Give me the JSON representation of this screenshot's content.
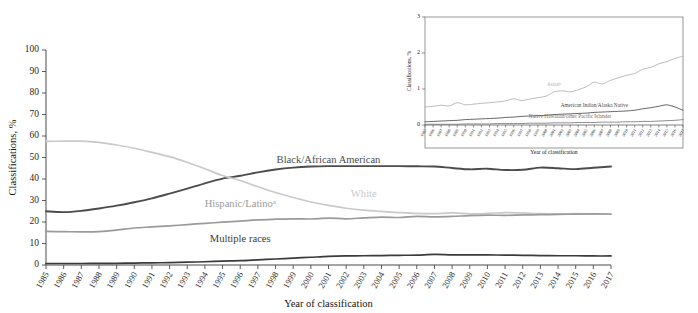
{
  "figure": {
    "title": "",
    "background": "#ffffff"
  },
  "chart_data": [
    {
      "id": "main",
      "type": "line",
      "title": "",
      "xlabel": "Year of classification",
      "ylabel": "Classifications, %",
      "ylim": [
        0,
        100
      ],
      "yticks": [
        0,
        10,
        20,
        30,
        40,
        50,
        60,
        70,
        80,
        90,
        100
      ],
      "xlim": [
        1985,
        2017
      ],
      "grid": false,
      "legend_position": "inline-labels",
      "x": [
        1985,
        1986,
        1987,
        1988,
        1989,
        1990,
        1991,
        1992,
        1993,
        1994,
        1995,
        1996,
        1997,
        1998,
        1999,
        2000,
        2001,
        2002,
        2003,
        2004,
        2005,
        2006,
        2007,
        2008,
        2009,
        2010,
        2011,
        2012,
        2013,
        2014,
        2015,
        2016,
        2017
      ],
      "xticklabels": [
        "1985",
        "1986",
        "1987",
        "1988",
        "1989",
        "1990",
        "1991",
        "1992",
        "1993",
        "1994",
        "1995",
        "1996",
        "1997",
        "1998",
        "1999",
        "2000",
        "2001",
        "2002",
        "2003",
        "2004",
        "2005",
        "2006",
        "2007",
        "2008",
        "2009",
        "2010",
        "2011",
        "2012",
        "2013",
        "2014",
        "2015",
        "2016",
        "2017"
      ],
      "series": [
        {
          "name": "Black/African American",
          "label": "Black/African American",
          "color": "#4c4c4c",
          "width": 1.9,
          "label_x": 2001,
          "label_y": 47.5,
          "values": [
            25.0,
            24.6,
            25.2,
            26.3,
            27.6,
            29.2,
            31.0,
            33.2,
            35.5,
            38.0,
            40.2,
            41.5,
            43.1,
            44.4,
            45.3,
            45.8,
            46.0,
            46.0,
            46.0,
            46.0,
            46.0,
            45.9,
            45.8,
            45.1,
            44.5,
            44.8,
            44.2,
            44.3,
            45.3,
            45.0,
            44.6,
            45.2,
            45.8
          ]
        },
        {
          "name": "White",
          "label": "White",
          "color": "#c9c9c9",
          "width": 1.7,
          "label_x": 2003,
          "label_y": 31.5,
          "values": [
            57.5,
            57.6,
            57.6,
            57.0,
            55.8,
            54.3,
            52.4,
            50.4,
            47.8,
            44.8,
            41.6,
            39.3,
            36.4,
            33.7,
            31.4,
            29.3,
            27.7,
            26.4,
            25.5,
            24.9,
            24.4,
            24.0,
            23.9,
            24.2,
            23.8,
            24.0,
            24.4,
            24.2,
            23.9,
            23.8,
            23.9,
            23.8,
            23.6
          ]
        },
        {
          "name": "Hispanic/Latino",
          "label": "Hispanic/Latinoᵃ",
          "color": "#9a9a9a",
          "width": 1.7,
          "label_x": 1996,
          "label_y": 27.0,
          "values": [
            15.6,
            15.5,
            15.4,
            15.5,
            16.2,
            17.2,
            17.7,
            18.2,
            18.8,
            19.4,
            19.9,
            20.4,
            21.0,
            21.3,
            21.5,
            21.4,
            21.8,
            21.5,
            21.9,
            22.3,
            22.1,
            22.6,
            22.4,
            22.6,
            23.0,
            23.2,
            23.1,
            23.3,
            23.4,
            23.5,
            23.7,
            23.8,
            23.7
          ]
        },
        {
          "name": "Multiple races",
          "label": "Multiple races",
          "color": "#3b3b3b",
          "width": 1.7,
          "label_x": 1996,
          "label_y": 10.5,
          "values": [
            0.7,
            0.7,
            0.7,
            0.8,
            0.8,
            0.9,
            1.0,
            1.1,
            1.3,
            1.5,
            1.8,
            2.0,
            2.4,
            2.8,
            3.2,
            3.6,
            4.0,
            4.2,
            4.3,
            4.4,
            4.5,
            4.6,
            4.9,
            4.7,
            4.7,
            4.7,
            4.6,
            4.5,
            4.4,
            4.3,
            4.3,
            4.2,
            4.2
          ]
        }
      ]
    },
    {
      "id": "inset",
      "type": "line",
      "title": "",
      "xlabel": "Year of classification",
      "ylabel": "Classifications, %",
      "ylim": [
        0,
        3
      ],
      "yticks": [
        0,
        1,
        2,
        3
      ],
      "xlim": [
        1985,
        2017
      ],
      "grid": false,
      "legend_position": "inline-labels",
      "x": [
        1985,
        1986,
        1987,
        1988,
        1989,
        1990,
        1991,
        1992,
        1993,
        1994,
        1995,
        1996,
        1997,
        1998,
        1999,
        2000,
        2001,
        2002,
        2003,
        2004,
        2005,
        2006,
        2007,
        2008,
        2009,
        2010,
        2011,
        2012,
        2013,
        2014,
        2015,
        2016,
        2017
      ],
      "xticklabels": [
        "1985",
        "1986",
        "1987",
        "1988",
        "1989",
        "1990",
        "1991",
        "1992",
        "1993",
        "1994",
        "1995",
        "1996",
        "1997",
        "1998",
        "1999",
        "2000",
        "2001",
        "2002",
        "2003",
        "2004",
        "2005",
        "2006",
        "2007",
        "2008",
        "2009",
        "2010",
        "2011",
        "2012",
        "2013",
        "2014",
        "2015",
        "2016",
        "2017"
      ],
      "series": [
        {
          "name": "Asian",
          "label": "Asianᵇ",
          "color": "#b4b4b4",
          "width": 0.9,
          "label_x": 2001,
          "label_y": 1.08,
          "values": [
            0.5,
            0.52,
            0.55,
            0.53,
            0.62,
            0.56,
            0.58,
            0.6,
            0.62,
            0.64,
            0.67,
            0.73,
            0.68,
            0.72,
            0.76,
            0.8,
            0.92,
            0.95,
            0.92,
            0.98,
            1.06,
            1.19,
            1.14,
            1.24,
            1.31,
            1.38,
            1.43,
            1.55,
            1.6,
            1.7,
            1.76,
            1.85,
            1.91
          ]
        },
        {
          "name": "American Indian/Alaska Native",
          "label": "American Indian/Alaska Native",
          "color": "#4a4a4a",
          "width": 0.85,
          "label_x": 2006,
          "label_y": 0.5,
          "values": [
            0.09,
            0.1,
            0.11,
            0.12,
            0.13,
            0.15,
            0.16,
            0.17,
            0.18,
            0.19,
            0.21,
            0.22,
            0.24,
            0.25,
            0.26,
            0.27,
            0.29,
            0.3,
            0.31,
            0.32,
            0.33,
            0.35,
            0.36,
            0.37,
            0.38,
            0.39,
            0.41,
            0.45,
            0.48,
            0.52,
            0.56,
            0.5,
            0.41
          ]
        },
        {
          "name": "Native Hawaiian/other Pacific Islander",
          "label": "Native Hawaiian/other Pacific Islander",
          "color": "#6e6e6e",
          "width": 0.8,
          "label_x": 2003,
          "label_y": 0.2,
          "values": [
            0.02,
            0.02,
            0.02,
            0.02,
            0.02,
            0.03,
            0.03,
            0.03,
            0.03,
            0.04,
            0.04,
            0.04,
            0.04,
            0.05,
            0.05,
            0.05,
            0.06,
            0.06,
            0.06,
            0.07,
            0.07,
            0.07,
            0.08,
            0.08,
            0.08,
            0.09,
            0.09,
            0.1,
            0.1,
            0.11,
            0.12,
            0.13,
            0.15
          ]
        }
      ]
    }
  ],
  "axes": {
    "main": {
      "ylabel": "Classifications, %",
      "xlabel": "Year of classification"
    },
    "inset": {
      "ylabel": "Classifications, %",
      "xlabel": "Year of classification"
    }
  }
}
